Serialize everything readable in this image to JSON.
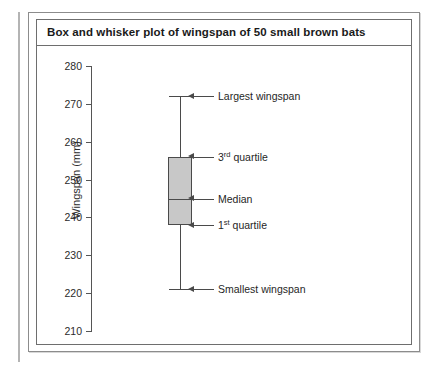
{
  "figure": {
    "title": "Box and whisker plot of wingspan of 50 small brown bats"
  },
  "chart_data": {
    "type": "box",
    "title": "Box and whisker plot of wingspan of 50 small brown bats",
    "xlabel": "",
    "ylabel": "Wingspan (mm)",
    "ylim": [
      210,
      280
    ],
    "ytick_labels": [
      "280",
      "270",
      "260",
      "250",
      "240",
      "230",
      "220",
      "210"
    ],
    "ytick_values": [
      280,
      270,
      260,
      250,
      240,
      230,
      220,
      210
    ],
    "grid": false,
    "legend": "none",
    "sample_size": 50,
    "boxes": [
      {
        "name": "Small brown bat wingspan",
        "min": 221,
        "q1": 238,
        "median": 245,
        "q3": 256,
        "max": 272
      }
    ],
    "annotations": [
      {
        "key": "max",
        "text_plain": "Largest wingspan",
        "text_pre": "Largest wingspan",
        "sup": "",
        "text_post": "",
        "value": 272
      },
      {
        "key": "q3",
        "text_plain": "3rd quartile",
        "text_pre": "3",
        "sup": "rd",
        "text_post": " quartile",
        "value": 256
      },
      {
        "key": "median",
        "text_plain": "Median",
        "text_pre": "Median",
        "sup": "",
        "text_post": "",
        "value": 245
      },
      {
        "key": "q1",
        "text_plain": "1st quartile",
        "text_pre": "1",
        "sup": "st",
        "text_post": " quartile",
        "value": 238
      },
      {
        "key": "min",
        "text_plain": "Smallest wingspan",
        "text_pre": "Smallest wingspan",
        "sup": "",
        "text_post": "",
        "value": 221
      }
    ],
    "colors": {
      "box_fill": "#c8c8c8",
      "box_stroke": "#4a4a4a",
      "axis": "#555555",
      "text": "#1f1f1f"
    }
  }
}
